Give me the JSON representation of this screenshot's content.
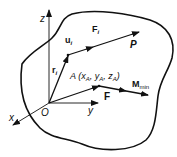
{
  "diagram": {
    "type": "rigid body force system",
    "colors": {
      "stroke": "#111111",
      "background": "#ffffff"
    },
    "axes": {
      "z_label": "z",
      "x_label": "x",
      "y_label": "y",
      "origin_label": "O"
    },
    "vectors": {
      "r_i": {
        "main": "r",
        "sub": "i"
      },
      "u_i": {
        "main": "u",
        "sub": "i"
      },
      "F_i": {
        "main": "F",
        "sub": "i"
      },
      "P": "P",
      "F": "F",
      "M_min": {
        "main": "M",
        "sub": "min"
      }
    },
    "point_A": {
      "text_A": "A (x",
      "sub1": "A",
      "comma1": ", y",
      "sub2": "A",
      "comma2": ", z",
      "sub3": "A",
      "close": ")"
    }
  }
}
